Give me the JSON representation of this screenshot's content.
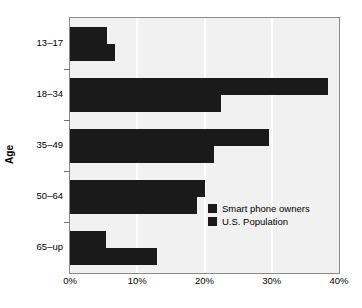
{
  "chart_data": {
    "type": "bar",
    "orientation": "horizontal",
    "title": "",
    "xlabel": "",
    "ylabel": "Age",
    "categories": [
      "13–17",
      "18–34",
      "35–49",
      "50–64",
      "65–up"
    ],
    "series": [
      {
        "name": "Smart phone owners",
        "values": [
          5.5,
          38.4,
          29.6,
          20.0,
          5.4
        ]
      },
      {
        "name": "U.S. Population",
        "values": [
          6.7,
          22.5,
          21.4,
          18.9,
          13.0
        ]
      }
    ],
    "xlim": [
      0,
      40
    ],
    "xticks": [
      0,
      10,
      20,
      30,
      40
    ],
    "xtick_labels": [
      "0%",
      "10%",
      "20%",
      "30%",
      "40%"
    ],
    "grid": true,
    "grid_axis": "x",
    "legend_position": "bottom-right",
    "colors": {
      "bar": "#1a1a1a",
      "plot_background": "#f1f1f1",
      "gridline": "#ffffff",
      "frame": "#8a8a8a",
      "text": "#000000",
      "page_background": "#ffffff"
    }
  },
  "legend": {
    "items": [
      {
        "label": "Smart phone owners",
        "swatch_name": "legend-swatch-smart-phone-owners"
      },
      {
        "label": "U.S. Population",
        "swatch_name": "legend-swatch-us-population"
      }
    ]
  }
}
